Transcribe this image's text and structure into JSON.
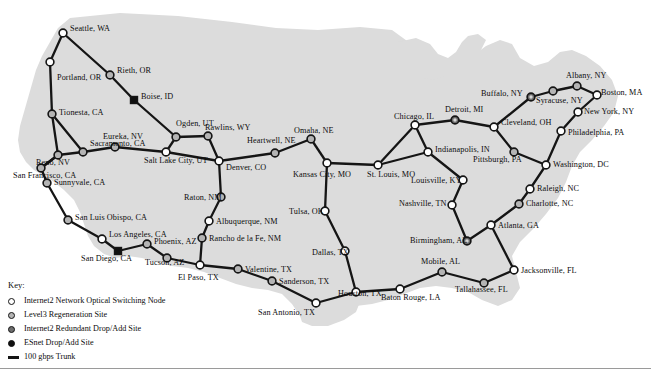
{
  "map": {
    "title": "Internet2 Network Optical Map",
    "background_color": "#ffffff",
    "landmass_color": "#dcdcdc",
    "trunk_color": "#151515",
    "node_colors": {
      "switching": "#ffffff",
      "regeneration": "#b4b4b4",
      "redundant": "#6e6e6e",
      "esnet": "#101010"
    }
  },
  "legend": {
    "title": "Key:",
    "items": [
      {
        "id": "switching",
        "icon": "open-circle-icon",
        "label": "Internet2 Network Optical Switching Node"
      },
      {
        "id": "regeneration",
        "icon": "light-grey-circle-icon",
        "label": "Level3 Regeneration Site"
      },
      {
        "id": "redundant",
        "icon": "dark-grey-circle-icon",
        "label": "Internet2 Redundant Drop/Add Site"
      },
      {
        "id": "esnet",
        "icon": "filled-black-circle-icon",
        "label": "ESnet Drop/Add Site"
      },
      {
        "id": "trunk",
        "icon": "thick-line-icon",
        "label": "100 gbps Trunk"
      }
    ]
  },
  "nodes": [
    {
      "id": "seattle",
      "label": "Seattle, WA",
      "type": "switching",
      "x": 63,
      "y": 33,
      "lx": 70,
      "ly": 29
    },
    {
      "id": "portland",
      "label": "Portland, OR",
      "type": "switching",
      "x": 50,
      "y": 62,
      "lx": 57,
      "ly": 78
    },
    {
      "id": "rieth",
      "label": "Rieth, OR",
      "type": "regeneration",
      "x": 110,
      "y": 75,
      "lx": 117,
      "ly": 71
    },
    {
      "id": "boise",
      "label": "Boise, ID",
      "type": "esnet",
      "x": 134,
      "y": 100,
      "lx": 141,
      "ly": 97
    },
    {
      "id": "tionesta",
      "label": "Tionesta, CA",
      "type": "regeneration",
      "x": 52,
      "y": 114,
      "lx": 59,
      "ly": 113
    },
    {
      "id": "ogden",
      "label": "Ogden, UT",
      "type": "regeneration",
      "x": 176,
      "y": 137,
      "lx": 176,
      "ly": 124
    },
    {
      "id": "rawlins",
      "label": "Rawlins, WY",
      "type": "regeneration",
      "x": 208,
      "y": 136,
      "lx": 205,
      "ly": 128
    },
    {
      "id": "eureka",
      "label": "Eureka, NV",
      "type": "regeneration",
      "x": 115,
      "y": 147,
      "lx": 103,
      "ly": 137
    },
    {
      "id": "sacramento",
      "label": "Sacramento, CA",
      "type": "regeneration",
      "x": 83,
      "y": 152,
      "lx": 90,
      "ly": 144
    },
    {
      "id": "saltlakecity",
      "label": "Salt Lake City, UT",
      "type": "switching",
      "x": 166,
      "y": 152,
      "lx": 144,
      "ly": 161
    },
    {
      "id": "heartwell",
      "label": "Heartwell, NE",
      "type": "regeneration",
      "x": 275,
      "y": 153,
      "lx": 247,
      "ly": 141
    },
    {
      "id": "omaha",
      "label": "Omaha, NE",
      "type": "regeneration",
      "x": 311,
      "y": 139,
      "lx": 294,
      "ly": 131
    },
    {
      "id": "reno",
      "label": "Reno, NV",
      "type": "regeneration",
      "x": 58,
      "y": 155,
      "lx": 36,
      "ly": 163
    },
    {
      "id": "denver",
      "label": "Denver, CO",
      "type": "switching",
      "x": 219,
      "y": 161,
      "lx": 226,
      "ly": 168
    },
    {
      "id": "kansascity",
      "label": "Kansas City, MO",
      "type": "switching",
      "x": 327,
      "y": 163,
      "lx": 293,
      "ly": 175
    },
    {
      "id": "sanfrancisco",
      "label": "San Francisco, CA",
      "type": "regeneration",
      "x": 41,
      "y": 168,
      "lx": 13,
      "ly": 176
    },
    {
      "id": "stlouis",
      "label": "St. Louis, MO",
      "type": "switching",
      "x": 378,
      "y": 165,
      "lx": 367,
      "ly": 175
    },
    {
      "id": "sunnyvale",
      "label": "Sunnyvale, CA",
      "type": "regeneration",
      "x": 47,
      "y": 183,
      "lx": 54,
      "ly": 183
    },
    {
      "id": "chicago",
      "label": "Chicago, IL",
      "type": "switching",
      "x": 415,
      "y": 125,
      "lx": 394,
      "ly": 117
    },
    {
      "id": "detroit",
      "label": "Detroit, MI",
      "type": "redundant",
      "x": 455,
      "y": 120,
      "lx": 445,
      "ly": 110
    },
    {
      "id": "cleveland",
      "label": "Cleveland, OH",
      "type": "switching",
      "x": 494,
      "y": 127,
      "lx": 501,
      "ly": 123
    },
    {
      "id": "buffalo",
      "label": "Buffalo, NY",
      "type": "redundant",
      "x": 531,
      "y": 97,
      "lx": 481,
      "ly": 94
    },
    {
      "id": "syracuse",
      "label": "Syracuse, NY",
      "type": "regeneration",
      "x": 553,
      "y": 91,
      "lx": 536,
      "ly": 101
    },
    {
      "id": "albany",
      "label": "Albany, NY",
      "type": "regeneration",
      "x": 577,
      "y": 86,
      "lx": 566,
      "ly": 76
    },
    {
      "id": "boston",
      "label": "Boston, MA",
      "type": "switching",
      "x": 597,
      "y": 95,
      "lx": 601,
      "ly": 93
    },
    {
      "id": "newyork",
      "label": "New York, NY",
      "type": "switching",
      "x": 578,
      "y": 112,
      "lx": 584,
      "ly": 112
    },
    {
      "id": "philadelphia",
      "label": "Philadelphia, PA",
      "type": "switching",
      "x": 561,
      "y": 131,
      "lx": 568,
      "ly": 133
    },
    {
      "id": "indianapolis",
      "label": "Indianapolis, IN",
      "type": "switching",
      "x": 428,
      "y": 152,
      "lx": 435,
      "ly": 150
    },
    {
      "id": "pittsburgh",
      "label": "Pittsburgh, PA",
      "type": "regeneration",
      "x": 514,
      "y": 152,
      "lx": 473,
      "ly": 160
    },
    {
      "id": "washington",
      "label": "Washington, DC",
      "type": "switching",
      "x": 546,
      "y": 165,
      "lx": 553,
      "ly": 165
    },
    {
      "id": "louisville",
      "label": "Louisville, KY",
      "type": "switching",
      "x": 463,
      "y": 180,
      "lx": 411,
      "ly": 181
    },
    {
      "id": "raleigh",
      "label": "Raleigh, NC",
      "type": "switching",
      "x": 530,
      "y": 189,
      "lx": 537,
      "ly": 189
    },
    {
      "id": "nashville",
      "label": "Nashville, TN",
      "type": "switching",
      "x": 452,
      "y": 205,
      "lx": 399,
      "ly": 204
    },
    {
      "id": "charlotte",
      "label": "Charlotte, NC",
      "type": "regeneration",
      "x": 519,
      "y": 204,
      "lx": 526,
      "ly": 204
    },
    {
      "id": "raton",
      "label": "Raton, NM",
      "type": "regeneration",
      "x": 221,
      "y": 197,
      "lx": 184,
      "ly": 198
    },
    {
      "id": "sanluisobispo",
      "label": "San Luis Obispo, CA",
      "type": "regeneration",
      "x": 68,
      "y": 220,
      "lx": 75,
      "ly": 218
    },
    {
      "id": "albuquerque",
      "label": "Albuquerque, NM",
      "type": "switching",
      "x": 209,
      "y": 221,
      "lx": 216,
      "ly": 222
    },
    {
      "id": "tulsa",
      "label": "Tulsa, OK",
      "type": "switching",
      "x": 325,
      "y": 211,
      "lx": 289,
      "ly": 212
    },
    {
      "id": "atlanta",
      "label": "Atlanta, GA",
      "type": "switching",
      "x": 491,
      "y": 225,
      "lx": 498,
      "ly": 226
    },
    {
      "id": "losangeles",
      "label": "Los Angeles, CA",
      "type": "switching",
      "x": 102,
      "y": 239,
      "lx": 109,
      "ly": 235
    },
    {
      "id": "ranchodelafe",
      "label": "Rancho de la Fe, NM",
      "type": "regeneration",
      "x": 202,
      "y": 238,
      "lx": 209,
      "ly": 239
    },
    {
      "id": "phoenix",
      "label": "Phoenix, AZ",
      "type": "regeneration",
      "x": 147,
      "y": 244,
      "lx": 154,
      "ly": 242
    },
    {
      "id": "dallas",
      "label": "Dallas, TX",
      "type": "switching",
      "x": 345,
      "y": 251,
      "lx": 312,
      "ly": 253
    },
    {
      "id": "birmingham",
      "label": "Birmingham, AL",
      "type": "redundant",
      "x": 467,
      "y": 241,
      "lx": 410,
      "ly": 241
    },
    {
      "id": "sandiego",
      "label": "San Diego, CA",
      "type": "esnet",
      "x": 118,
      "y": 251,
      "lx": 81,
      "ly": 259
    },
    {
      "id": "tucson",
      "label": "Tucson, AZ",
      "type": "regeneration",
      "x": 167,
      "y": 258,
      "lx": 145,
      "ly": 263
    },
    {
      "id": "jacksonville",
      "label": "Jacksonville, FL",
      "type": "switching",
      "x": 514,
      "y": 270,
      "lx": 521,
      "ly": 271
    },
    {
      "id": "valentine",
      "label": "Valentine, TX",
      "type": "regeneration",
      "x": 238,
      "y": 269,
      "lx": 245,
      "ly": 270
    },
    {
      "id": "elpaso",
      "label": "El Paso, TX",
      "type": "switching",
      "x": 200,
      "y": 265,
      "lx": 178,
      "ly": 278
    },
    {
      "id": "mobile",
      "label": "Mobile, AL",
      "type": "regeneration",
      "x": 442,
      "y": 272,
      "lx": 421,
      "ly": 262
    },
    {
      "id": "sanderson",
      "label": "Sanderson, TX",
      "type": "regeneration",
      "x": 272,
      "y": 281,
      "lx": 279,
      "ly": 282
    },
    {
      "id": "houston",
      "label": "Houston, TX",
      "type": "switching",
      "x": 356,
      "y": 292,
      "lx": 338,
      "ly": 294
    },
    {
      "id": "tallahassee",
      "label": "Tallahassee, FL",
      "type": "regeneration",
      "x": 484,
      "y": 283,
      "lx": 455,
      "ly": 290
    },
    {
      "id": "batonrouge",
      "label": "Baton Rouge, LA",
      "type": "switching",
      "x": 400,
      "y": 289,
      "lx": 381,
      "ly": 298
    },
    {
      "id": "sanantonio",
      "label": "San Antonio, TX",
      "type": "switching",
      "x": 316,
      "y": 303,
      "lx": 258,
      "ly": 313
    }
  ],
  "links": [
    [
      "seattle",
      "portland"
    ],
    [
      "seattle",
      "rieth"
    ],
    [
      "rieth",
      "boise"
    ],
    [
      "boise",
      "ogden"
    ],
    [
      "portland",
      "tionesta"
    ],
    [
      "tionesta",
      "sacramento"
    ],
    [
      "tionesta",
      "reno"
    ],
    [
      "sacramento",
      "reno"
    ],
    [
      "sacramento",
      "eureka"
    ],
    [
      "eureka",
      "saltlakecity"
    ],
    [
      "ogden",
      "saltlakecity"
    ],
    [
      "ogden",
      "rawlins"
    ],
    [
      "rawlins",
      "denver"
    ],
    [
      "saltlakecity",
      "denver"
    ],
    [
      "reno",
      "sanfrancisco"
    ],
    [
      "sanfrancisco",
      "sunnyvale"
    ],
    [
      "sanfrancisco",
      "reno"
    ],
    [
      "sunnyvale",
      "sanluisobispo"
    ],
    [
      "sanluisobispo",
      "losangeles"
    ],
    [
      "losangeles",
      "sandiego"
    ],
    [
      "sandiego",
      "phoenix"
    ],
    [
      "phoenix",
      "tucson"
    ],
    [
      "tucson",
      "elpaso"
    ],
    [
      "elpaso",
      "ranchodelafe"
    ],
    [
      "ranchodelafe",
      "albuquerque"
    ],
    [
      "albuquerque",
      "raton"
    ],
    [
      "raton",
      "denver"
    ],
    [
      "elpaso",
      "valentine"
    ],
    [
      "valentine",
      "sanderson"
    ],
    [
      "sanderson",
      "sanantonio"
    ],
    [
      "sanantonio",
      "houston"
    ],
    [
      "houston",
      "dallas"
    ],
    [
      "dallas",
      "tulsa"
    ],
    [
      "tulsa",
      "kansascity"
    ],
    [
      "denver",
      "heartwell"
    ],
    [
      "heartwell",
      "omaha"
    ],
    [
      "omaha",
      "kansascity"
    ],
    [
      "kansascity",
      "stlouis"
    ],
    [
      "stlouis",
      "chicago"
    ],
    [
      "stlouis",
      "indianapolis"
    ],
    [
      "chicago",
      "indianapolis"
    ],
    [
      "chicago",
      "detroit"
    ],
    [
      "detroit",
      "cleveland"
    ],
    [
      "cleveland",
      "buffalo"
    ],
    [
      "buffalo",
      "syracuse"
    ],
    [
      "syracuse",
      "albany"
    ],
    [
      "albany",
      "boston"
    ],
    [
      "boston",
      "newyork"
    ],
    [
      "newyork",
      "philadelphia"
    ],
    [
      "philadelphia",
      "washington"
    ],
    [
      "cleveland",
      "pittsburgh"
    ],
    [
      "pittsburgh",
      "washington"
    ],
    [
      "washington",
      "raleigh"
    ],
    [
      "raleigh",
      "charlotte"
    ],
    [
      "charlotte",
      "atlanta"
    ],
    [
      "indianapolis",
      "louisville"
    ],
    [
      "louisville",
      "nashville"
    ],
    [
      "nashville",
      "birmingham"
    ],
    [
      "birmingham",
      "atlanta"
    ],
    [
      "atlanta",
      "jacksonville"
    ],
    [
      "jacksonville",
      "tallahassee"
    ],
    [
      "tallahassee",
      "mobile"
    ],
    [
      "mobile",
      "batonrouge"
    ],
    [
      "batonrouge",
      "houston"
    ]
  ]
}
